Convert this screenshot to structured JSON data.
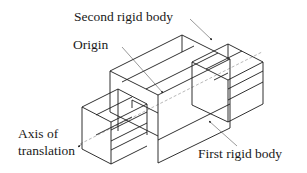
{
  "labels": {
    "second_rigid_body": "Second rigid body",
    "origin": "Origin",
    "axis_line1": "Axis of",
    "axis_line2": "translation",
    "first_rigid_body": "First rigid body"
  },
  "colors": {
    "line": "#1a1a1a",
    "axis": "#888888",
    "background": "#ffffff"
  }
}
